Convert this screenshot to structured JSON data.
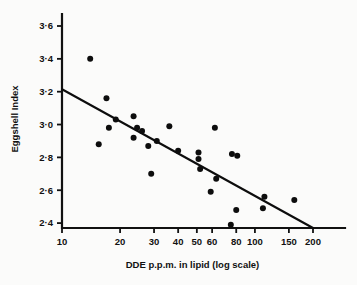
{
  "chart_data": {
    "type": "scatter",
    "title": "",
    "xlabel": "DDE p.p.m. in lipid (log scale)",
    "ylabel": "Eggshell Index",
    "xscale": "log",
    "yscale": "linear",
    "xlim": [
      10,
      200
    ],
    "ylim": [
      2.37,
      3.65
    ],
    "grid": false,
    "legend": "none",
    "x_tick_labels": [
      "10",
      "20",
      "30",
      "40",
      "50",
      "60",
      "80",
      "100",
      "150",
      "200"
    ],
    "x_tick_values": [
      10,
      20,
      30,
      40,
      50,
      60,
      80,
      100,
      150,
      200
    ],
    "y_tick_labels": [
      "3·6",
      "3·4",
      "3·2",
      "3·0",
      "2·8",
      "2·6",
      "2·4"
    ],
    "y_tick_values": [
      3.6,
      3.4,
      3.2,
      3.0,
      2.8,
      2.6,
      2.4
    ],
    "series": [
      {
        "name": "Eggshell samples",
        "marker": "filled-circle",
        "color": "#0d0d0d",
        "points": [
          {
            "x": 14.0,
            "y": 3.4
          },
          {
            "x": 17.0,
            "y": 3.16
          },
          {
            "x": 15.5,
            "y": 2.88
          },
          {
            "x": 17.5,
            "y": 2.98
          },
          {
            "x": 19.0,
            "y": 3.03
          },
          {
            "x": 23.5,
            "y": 3.05
          },
          {
            "x": 23.5,
            "y": 2.92
          },
          {
            "x": 24.5,
            "y": 2.98
          },
          {
            "x": 26.0,
            "y": 2.96
          },
          {
            "x": 28.0,
            "y": 2.87
          },
          {
            "x": 29.0,
            "y": 2.7
          },
          {
            "x": 31.0,
            "y": 2.9
          },
          {
            "x": 36.0,
            "y": 2.99
          },
          {
            "x": 40.0,
            "y": 2.84
          },
          {
            "x": 51.0,
            "y": 2.83
          },
          {
            "x": 51.0,
            "y": 2.79
          },
          {
            "x": 52.0,
            "y": 2.73
          },
          {
            "x": 59.0,
            "y": 2.59
          },
          {
            "x": 62.0,
            "y": 2.98
          },
          {
            "x": 63.0,
            "y": 2.67
          },
          {
            "x": 75.0,
            "y": 2.39
          },
          {
            "x": 76.0,
            "y": 2.82
          },
          {
            "x": 80.0,
            "y": 2.48
          },
          {
            "x": 81.0,
            "y": 2.81
          },
          {
            "x": 110.0,
            "y": 2.49
          },
          {
            "x": 112.0,
            "y": 2.56
          },
          {
            "x": 160.0,
            "y": 2.54
          }
        ]
      }
    ],
    "trend_line": {
      "name": "regression-line",
      "color": "#0d0d0d",
      "start": {
        "x": 10,
        "y": 3.215
      },
      "end": {
        "x": 200,
        "y": 2.37
      }
    },
    "colors": {
      "axis": "#111111",
      "marker": "#0d0d0d",
      "line": "#0d0d0d",
      "background": "#fbfbfa"
    }
  }
}
